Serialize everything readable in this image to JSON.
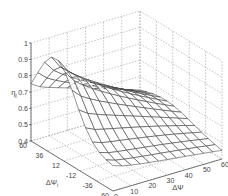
{
  "chart_data": {
    "type": "surface",
    "title": "",
    "zlabel": "η",
    "zlabel_subscript": "j",
    "xlabel": "ΔΨ",
    "ylabel": "ΔΨ",
    "ylabel_subscript": "i",
    "zlim": [
      0.4,
      1
    ],
    "xlim": [
      0,
      60
    ],
    "ylim": [
      -60,
      60
    ],
    "zticks": [
      "0.4",
      "0.5",
      "0.6",
      "0.7",
      "0.8",
      "0.9",
      "1"
    ],
    "xticks": [
      "0",
      "10",
      "20",
      "30",
      "40",
      "50",
      "60"
    ],
    "yticks": [
      "60",
      "36",
      "12",
      "-12",
      "-36",
      "-60"
    ],
    "grid": true,
    "surface_description": "Mesh surface peaking near η≈1 for small ΔΨ at ΔΨ_i≈12..36, decreasing toward η≈0.4 as ΔΨ increases and at extreme ΔΨ_i",
    "x_samples": [
      0,
      5,
      10,
      15,
      20,
      25,
      30,
      35,
      40,
      45,
      50,
      55,
      60
    ],
    "y_samples": [
      -60,
      -50,
      -40,
      -30,
      -20,
      -10,
      0,
      10,
      20,
      30,
      40,
      50,
      60
    ],
    "peak": {
      "x": 0,
      "y": 24,
      "z": 1.0
    },
    "corner_values": {
      "x0_ymin": 0.42,
      "x0_ymax": 0.55,
      "x60_ymin": 0.4,
      "x60_ymax": 0.45
    }
  }
}
